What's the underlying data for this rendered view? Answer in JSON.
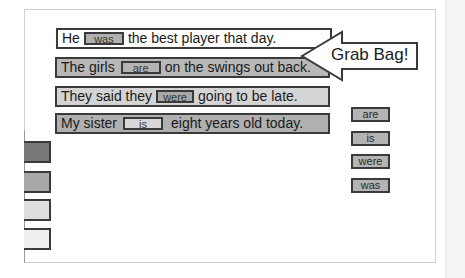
{
  "activity": {
    "sentences": [
      {
        "before": "He",
        "answer": "was",
        "after": "the best player that day.",
        "color": "#ffffff"
      },
      {
        "before": "The girls",
        "answer": "are",
        "after": "on the swings out back.",
        "color": "#b8b8b8"
      },
      {
        "before": "They said they",
        "answer": "were",
        "after": "going to be late.",
        "color": "#d4d4d4"
      },
      {
        "before": "My sister",
        "answer": "is",
        "after": "eight years old today.",
        "color": "#b0b0b0"
      }
    ],
    "grab_bag": {
      "label": "Grab Bag!",
      "icon": "left-arrow-icon",
      "items": [
        "are",
        "is",
        "were",
        "was"
      ]
    },
    "color_swatches": [
      "#777777",
      "#a8a8a8",
      "#dedede",
      "#efefef"
    ]
  }
}
